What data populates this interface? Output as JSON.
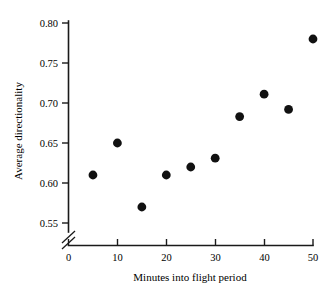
{
  "chart_data": {
    "type": "scatter",
    "title": "",
    "xlabel": "Minutes into flight period",
    "ylabel": "Average directionality",
    "xlim": [
      0,
      50
    ],
    "ylim": [
      0.55,
      0.8
    ],
    "grid": false,
    "legend": null,
    "y_axis_break": true,
    "y_axis_break_note": "axis break between 0 and 0.55",
    "xticks": [
      0,
      10,
      20,
      30,
      40,
      50
    ],
    "xtick_labels": [
      "0",
      "10",
      "20",
      "30",
      "40",
      "50"
    ],
    "yticks": [
      0.55,
      0.6,
      0.65,
      0.7,
      0.75,
      0.8
    ],
    "ytick_labels": [
      "0.55",
      "0.60",
      "0.65",
      "0.70",
      "0.75",
      "0.80"
    ],
    "x": [
      5,
      10,
      15,
      20,
      25,
      30,
      35,
      40,
      45,
      50
    ],
    "values": [
      0.61,
      0.65,
      0.57,
      0.61,
      0.62,
      0.631,
      0.683,
      0.711,
      0.692,
      0.78
    ],
    "points": [
      {
        "x": 5,
        "y": 0.61
      },
      {
        "x": 10,
        "y": 0.65
      },
      {
        "x": 15,
        "y": 0.57
      },
      {
        "x": 20,
        "y": 0.61
      },
      {
        "x": 25,
        "y": 0.62
      },
      {
        "x": 30,
        "y": 0.631
      },
      {
        "x": 35,
        "y": 0.683
      },
      {
        "x": 40,
        "y": 0.711
      },
      {
        "x": 45,
        "y": 0.692
      },
      {
        "x": 50,
        "y": 0.78
      }
    ],
    "marker": "filled-circle",
    "marker_color": "#111111"
  }
}
